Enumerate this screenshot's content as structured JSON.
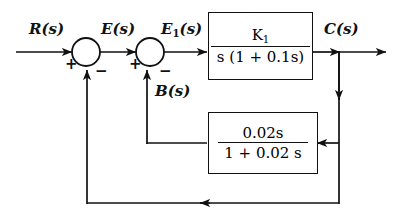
{
  "diagram": {
    "type": "control-system-block-diagram",
    "background_color": "#ffffff",
    "line_color": "#111111",
    "signals": {
      "input": "R(s)",
      "error": "E(s)",
      "inner_error": "E1(s)",
      "inner_error_base": "E",
      "inner_error_sub": "1",
      "inner_error_tail": "(s)",
      "feedback_inner": "B(s)",
      "output": "C(s)"
    },
    "summing_junctions": [
      {
        "name": "outer-summing-junction",
        "input_sign": "+",
        "feedback_sign": "−"
      },
      {
        "name": "inner-summing-junction",
        "input_sign": "+",
        "feedback_sign": "−"
      }
    ],
    "blocks": [
      {
        "name": "forward-transfer-function",
        "numerator": "K1",
        "numerator_base": "K",
        "numerator_sub": "1",
        "denominator": "s (1 + 0.1s)",
        "transfer_function": "K1 / [s (1 + 0.1s)]"
      },
      {
        "name": "feedback-transfer-function",
        "numerator": "0.02s",
        "denominator": "1 + 0.02 s",
        "transfer_function": "0.02s / (1 + 0.02 s)"
      }
    ]
  }
}
